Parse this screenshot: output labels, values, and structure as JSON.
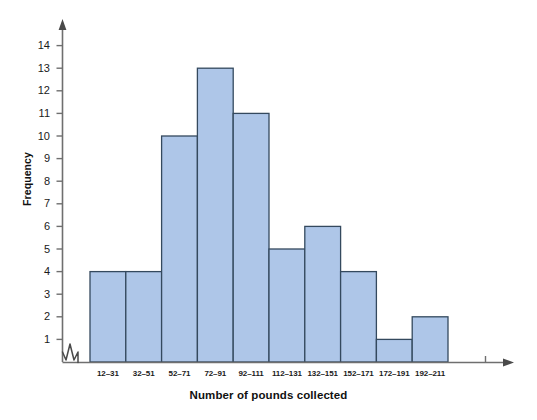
{
  "chart_data": {
    "type": "bar",
    "title": "",
    "subtitle": "",
    "xlabel": "Number of pounds collected",
    "ylabel": "Frequency",
    "categories": [
      "12–31",
      "32–51",
      "52–71",
      "72–91",
      "92–111",
      "112–131",
      "132–151",
      "152–171",
      "172–191",
      "192–211"
    ],
    "values": [
      4,
      4,
      10,
      13,
      11,
      5,
      6,
      4,
      1,
      2
    ],
    "ylim": [
      0,
      14.8
    ],
    "yticks": [
      1,
      2,
      3,
      4,
      5,
      6,
      7,
      8,
      9,
      10,
      11,
      12,
      13,
      14
    ],
    "ytick_labels": [
      "1",
      "2",
      "3",
      "4",
      "5",
      "6",
      "7",
      "8",
      "9",
      "10",
      "11",
      "12",
      "13",
      "14"
    ],
    "grid": false,
    "legend": false,
    "axis_break": true,
    "bar_fill_color": "#aec6e8",
    "bar_edge_color": "#34495e",
    "axis_color": "#6f6f6f",
    "text_color": "#111111"
  }
}
